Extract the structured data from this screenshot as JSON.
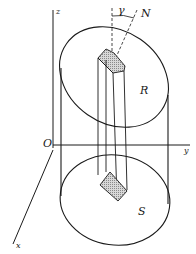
{
  "figure": {
    "type": "cylinder-with-prism",
    "labels": {
      "z_axis": "z",
      "y_axis": "y",
      "x_axis": "x",
      "origin": "O",
      "angle": "γ",
      "normal": "N",
      "top_surface": "R",
      "bottom_surface": "S"
    },
    "colors": {
      "stroke": "#1a1a1a",
      "hatch": "#9a9a9a",
      "background": "#ffffff"
    }
  }
}
